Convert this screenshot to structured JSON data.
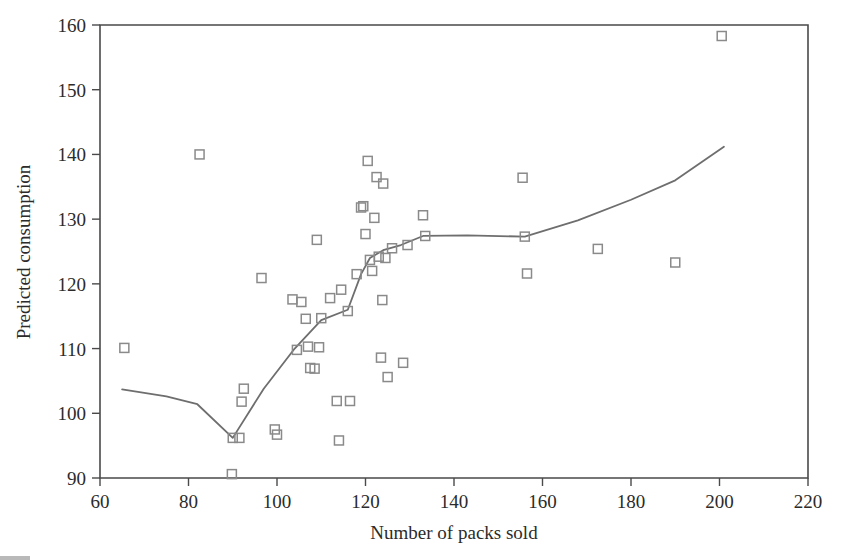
{
  "chart_data": {
    "type": "scatter",
    "title": "",
    "xlabel": "Number of packs sold",
    "ylabel": "Predicted consumption",
    "xlim": [
      60,
      220
    ],
    "ylim": [
      90,
      160
    ],
    "xticks": [
      60,
      80,
      100,
      120,
      140,
      160,
      180,
      200,
      220
    ],
    "yticks": [
      90,
      100,
      110,
      120,
      130,
      140,
      150,
      160
    ],
    "grid": false,
    "legend": "none",
    "marker": "open-square",
    "marker_color": "#8a8a8a",
    "line_color": "#6e6e6e",
    "axis_color": "#4a4a4a",
    "series": [
      {
        "name": "observations",
        "type": "scatter",
        "points": [
          [
            65.5,
            110.1
          ],
          [
            82.5,
            140.0
          ],
          [
            89.8,
            90.6
          ],
          [
            90.0,
            96.2
          ],
          [
            91.5,
            96.2
          ],
          [
            92.0,
            101.8
          ],
          [
            92.5,
            103.8
          ],
          [
            96.5,
            120.9
          ],
          [
            99.5,
            97.5
          ],
          [
            100.0,
            96.7
          ],
          [
            103.5,
            117.6
          ],
          [
            104.5,
            109.8
          ],
          [
            105.5,
            117.2
          ],
          [
            106.5,
            114.6
          ],
          [
            107.0,
            110.3
          ],
          [
            107.5,
            107.0
          ],
          [
            108.5,
            106.9
          ],
          [
            109.0,
            126.8
          ],
          [
            109.5,
            110.2
          ],
          [
            110.0,
            114.7
          ],
          [
            112.0,
            117.8
          ],
          [
            113.5,
            101.9
          ],
          [
            114.0,
            95.8
          ],
          [
            114.5,
            119.1
          ],
          [
            116.0,
            115.8
          ],
          [
            116.5,
            101.9
          ],
          [
            118.0,
            121.5
          ],
          [
            119.0,
            131.8
          ],
          [
            119.5,
            132.0
          ],
          [
            120.0,
            127.7
          ],
          [
            120.5,
            139.0
          ],
          [
            121.0,
            123.7
          ],
          [
            121.5,
            122.0
          ],
          [
            122.0,
            130.2
          ],
          [
            122.5,
            136.5
          ],
          [
            123.0,
            124.2
          ],
          [
            123.5,
            108.6
          ],
          [
            123.8,
            117.5
          ],
          [
            124.0,
            135.5
          ],
          [
            124.5,
            124.0
          ],
          [
            125.0,
            105.6
          ],
          [
            126.0,
            125.5
          ],
          [
            128.5,
            107.8
          ],
          [
            129.5,
            126.0
          ],
          [
            133.0,
            130.6
          ],
          [
            133.5,
            127.4
          ],
          [
            155.5,
            136.4
          ],
          [
            156.0,
            127.3
          ],
          [
            156.5,
            121.6
          ],
          [
            172.5,
            125.4
          ],
          [
            190.0,
            123.3
          ],
          [
            200.5,
            158.3
          ]
        ]
      },
      {
        "name": "lowess-trend",
        "type": "line",
        "points": [
          [
            65.0,
            103.7
          ],
          [
            75.0,
            102.6
          ],
          [
            82.0,
            101.4
          ],
          [
            90.0,
            96.2
          ],
          [
            97.0,
            103.8
          ],
          [
            104.0,
            110.0
          ],
          [
            110.0,
            114.4
          ],
          [
            116.0,
            116.0
          ],
          [
            119.0,
            121.5
          ],
          [
            121.0,
            124.0
          ],
          [
            124.0,
            125.2
          ],
          [
            128.0,
            126.0
          ],
          [
            133.0,
            127.4
          ],
          [
            143.0,
            127.5
          ],
          [
            156.0,
            127.3
          ],
          [
            168.0,
            129.8
          ],
          [
            180.0,
            133.0
          ],
          [
            190.0,
            136.0
          ],
          [
            201.0,
            141.2
          ]
        ]
      }
    ]
  },
  "axes": {
    "x_title": "Number of packs sold",
    "y_title": "Predicted consumption"
  }
}
